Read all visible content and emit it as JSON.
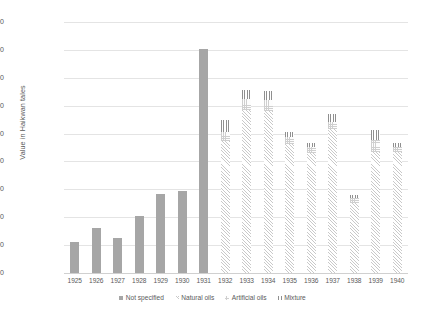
{
  "chart_data": {
    "type": "bar",
    "stacked": true,
    "title": "",
    "xlabel": "",
    "ylabel": "Value in Haikwan tales",
    "ylim": [
      0,
      1800000
    ],
    "ytick_step": 200000,
    "ytick_labels": [
      "1,800,000",
      "1,600,000",
      "1,400,000",
      "1,200,000",
      "1,000,000",
      "800,000",
      "600,000",
      "400,000",
      "200,000",
      "0"
    ],
    "grid": true,
    "legend_position": "bottom",
    "categories": [
      "1925",
      "1926",
      "1927",
      "1928",
      "1929",
      "1930",
      "1931",
      "1932",
      "1933",
      "1934",
      "1935",
      "1936",
      "1937",
      "1938",
      "1939",
      "1940"
    ],
    "series": [
      {
        "name": "Not specified",
        "color": "#a6a6a6",
        "pattern": "solid",
        "values": [
          225000,
          320000,
          250000,
          410000,
          565000,
          590000,
          1610000,
          0,
          0,
          0,
          0,
          0,
          0,
          0,
          0,
          0
        ]
      },
      {
        "name": "Natural oils",
        "color": "#c9c9c9",
        "pattern": "diagonal-hatch",
        "values": [
          0,
          0,
          0,
          0,
          0,
          0,
          0,
          947000,
          1170000,
          1160000,
          928000,
          860000,
          1030000,
          505000,
          870000,
          865000
        ]
      },
      {
        "name": "Artificial oils",
        "color": "#cfcfcf",
        "pattern": "checker",
        "values": [
          0,
          0,
          0,
          0,
          0,
          0,
          0,
          65000,
          80000,
          80000,
          47000,
          43000,
          55000,
          30000,
          85000,
          42000
        ]
      },
      {
        "name": "Mixture",
        "color": "#8f8f8f",
        "pattern": "vertical-lines",
        "values": [
          0,
          0,
          0,
          0,
          0,
          0,
          0,
          86000,
          62000,
          63000,
          37000,
          30000,
          55000,
          25000,
          70000,
          28000
        ]
      }
    ],
    "totals": [
      225000,
      320000,
      250000,
      410000,
      565000,
      590000,
      1610000,
      1098000,
      1312000,
      1303000,
      1012000,
      933000,
      1140000,
      560000,
      1025000,
      935000
    ]
  },
  "legend": {
    "items": [
      {
        "label": "Not specified"
      },
      {
        "label": "Natural oils"
      },
      {
        "label": "Artificial oils"
      },
      {
        "label": "Mixture"
      }
    ]
  }
}
